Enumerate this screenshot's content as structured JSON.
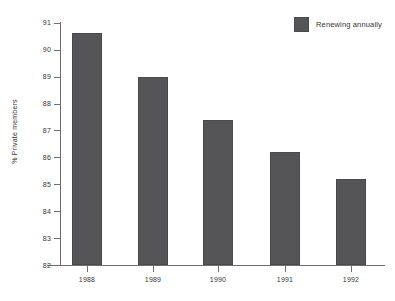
{
  "chart_data": {
    "type": "bar",
    "title": "",
    "subtitle": "",
    "xlabel": "",
    "ylabel": "% Private members",
    "categories": [
      "1988",
      "1989",
      "1990",
      "1991",
      "1992"
    ],
    "values": [
      90.6,
      89.0,
      87.4,
      86.2,
      85.2
    ],
    "series": [
      {
        "name": "Renewing annually",
        "color": "#555558",
        "values": [
          90.6,
          89.0,
          87.4,
          86.2,
          85.2
        ]
      }
    ],
    "ylim": [
      82,
      91
    ],
    "ytick_values": [
      82,
      83,
      84,
      85,
      86,
      87,
      88,
      89,
      90,
      91
    ],
    "ytick_labels": [
      "82",
      "83",
      "84",
      "85",
      "86",
      "87",
      "88",
      "89",
      "90",
      "91"
    ],
    "xtick_labels": [
      "1988",
      "1989",
      "1990",
      "1991",
      "1992"
    ],
    "grid": false,
    "legend": {
      "position": "top-right",
      "entries": [
        {
          "label": "Renewing annually",
          "color": "#555558"
        }
      ]
    },
    "axis_color": "#6d6d6d",
    "text_color": "#333333",
    "background": "#ffffff"
  }
}
